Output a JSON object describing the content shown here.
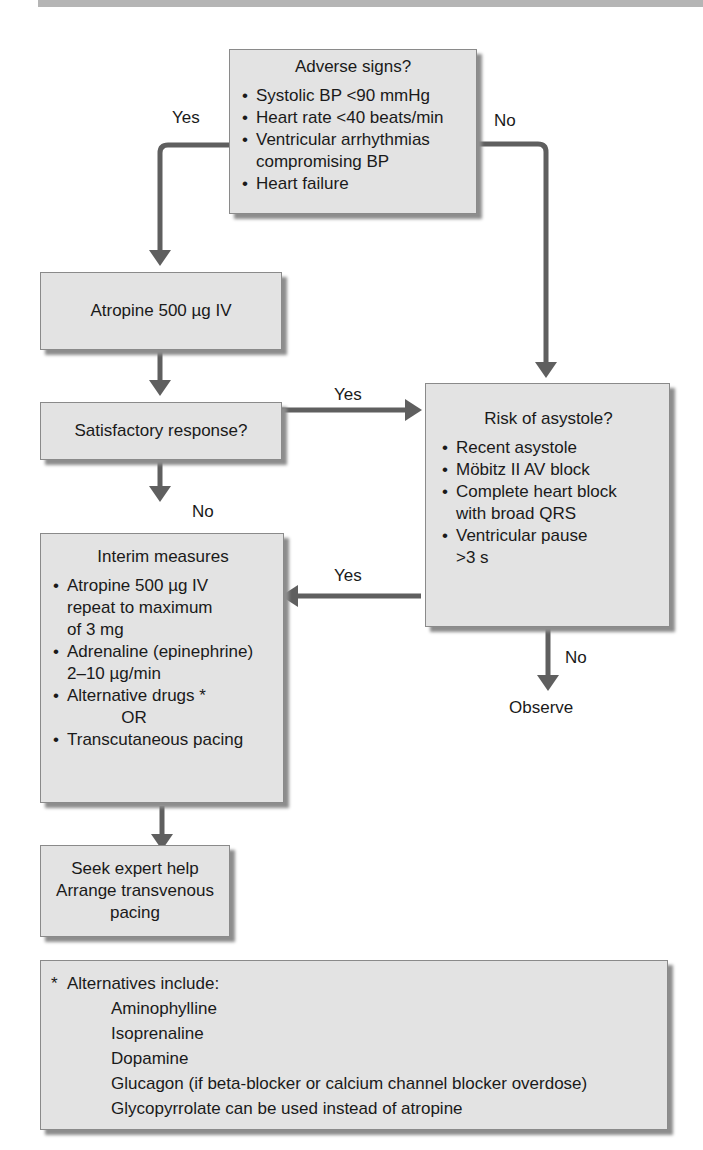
{
  "colors": {
    "box_fill": "#e3e3e3",
    "box_border": "#8a8a8a",
    "arrow": "#5f5f5f",
    "text": "#1a1a1a",
    "top_bar": "#b5b5b5"
  },
  "adverse_signs": {
    "title": "Adverse signs?",
    "items": [
      "Systolic BP <90 mmHg",
      "Heart rate <40 beats/min",
      "Ventricular arrhythmias",
      "compromising BP",
      "Heart failure"
    ]
  },
  "edge_labels": {
    "adverse_yes": "Yes",
    "adverse_no": "No",
    "response_yes": "Yes",
    "response_no": "No",
    "asystole_yes": "Yes",
    "asystole_no": "No"
  },
  "atropine": {
    "text": "Atropine 500 µg IV"
  },
  "satisfactory_response": {
    "text": "Satisfactory response?"
  },
  "risk_of_asystole": {
    "title": "Risk of asystole?",
    "items": [
      "Recent asystole",
      "Möbitz II AV block",
      "Complete heart block",
      "with broad QRS",
      "Ventricular pause",
      ">3 s"
    ]
  },
  "interim_measures": {
    "title": "Interim measures",
    "items": [
      "Atropine 500 µg IV",
      "repeat to maximum",
      "of 3 mg",
      "Adrenaline (epinephrine)",
      "2–10 µg/min",
      "Alternative drugs *",
      "OR",
      "Transcutaneous pacing"
    ]
  },
  "observe": {
    "text": "Observe"
  },
  "seek_expert": {
    "lines": [
      "Seek expert help",
      "Arrange transvenous",
      "pacing"
    ]
  },
  "footnote": {
    "star": "*",
    "heading": "Alternatives include:",
    "items": [
      "Aminophylline",
      "Isoprenaline",
      "Dopamine",
      "Glucagon (if beta-blocker or calcium channel blocker overdose)",
      "Glycopyrrolate can be used instead of atropine"
    ]
  }
}
